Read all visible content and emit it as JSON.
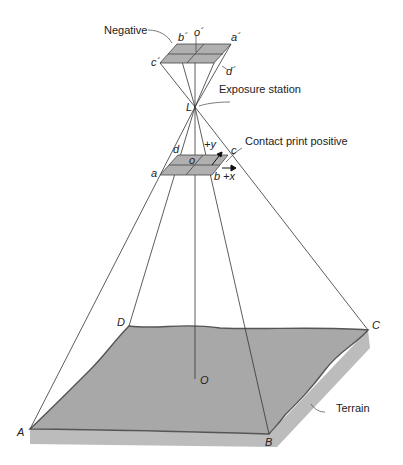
{
  "labels": {
    "negative": "Negative",
    "exposure_station": "Exposure station",
    "contact_print": "Contact print positive",
    "terrain": "Terrain"
  },
  "points": {
    "b_prime": "b´",
    "o_prime": "o´",
    "a_prime": "a´",
    "c_prime": "c´",
    "d_prime": "d´",
    "L": "L",
    "a": "a",
    "b": "b",
    "c": "c",
    "d": "d",
    "o": "o",
    "plus_x": "+x",
    "plus_y": "+y",
    "A": "A",
    "B": "B",
    "C": "C",
    "D": "D",
    "O": "O"
  },
  "colors": {
    "plane_fill": "#b0b0b0",
    "terrain_top": "#a8a8a8",
    "terrain_side": "#bcbcbc",
    "line": "#333333"
  }
}
